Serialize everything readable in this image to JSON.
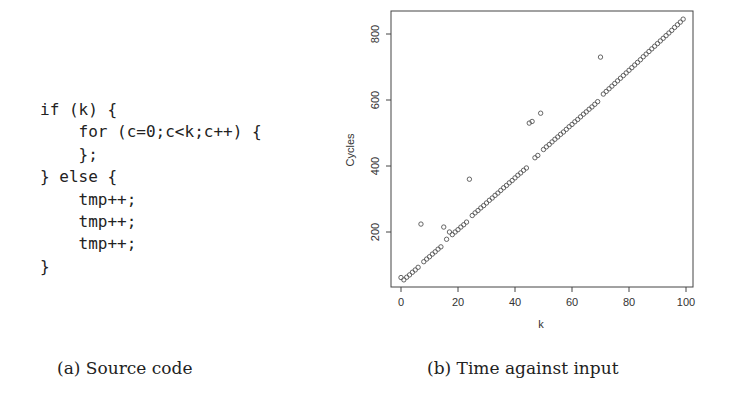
{
  "figure": {
    "panel_a": {
      "caption": "(a) Source code",
      "code_lines": [
        "if (k) {",
        "    for (c=0;c<k;c++) {",
        "    };",
        "} else {",
        "    tmp++;",
        "    tmp++;",
        "    tmp++;",
        "}"
      ]
    },
    "panel_b": {
      "caption": "(b) Time against input"
    }
  },
  "chart_data": {
    "type": "scatter",
    "title": "",
    "xlabel": "k",
    "ylabel": "Cycles",
    "xlim": [
      0,
      100
    ],
    "ylim": [
      33,
      870
    ],
    "xticks": [
      0,
      20,
      40,
      60,
      80,
      100
    ],
    "yticks": [
      200,
      400,
      600,
      800
    ],
    "grid": false,
    "legend": null,
    "marker": "open-circle",
    "x": [
      0,
      1,
      2,
      3,
      4,
      5,
      6,
      7,
      8,
      9,
      10,
      11,
      12,
      13,
      14,
      15,
      16,
      17,
      18,
      19,
      20,
      21,
      22,
      23,
      24,
      25,
      26,
      27,
      28,
      29,
      30,
      31,
      32,
      33,
      34,
      35,
      36,
      37,
      38,
      39,
      40,
      41,
      42,
      43,
      44,
      45,
      46,
      47,
      48,
      49,
      50,
      51,
      52,
      53,
      54,
      55,
      56,
      57,
      58,
      59,
      60,
      61,
      62,
      63,
      64,
      65,
      66,
      67,
      68,
      69,
      70,
      71,
      72,
      73,
      74,
      75,
      76,
      77,
      78,
      79,
      80,
      81,
      82,
      83,
      84,
      85,
      86,
      87,
      88,
      89,
      90,
      91,
      92,
      93,
      94,
      95,
      96,
      97,
      98,
      99
    ],
    "y": [
      62,
      55,
      63,
      70,
      78,
      85,
      93,
      224,
      110,
      118,
      125,
      133,
      140,
      148,
      155,
      215,
      178,
      200,
      192,
      200,
      207,
      215,
      222,
      230,
      360,
      250,
      258,
      265,
      273,
      280,
      288,
      296,
      303,
      311,
      318,
      326,
      334,
      341,
      349,
      356,
      364,
      372,
      379,
      387,
      394,
      530,
      535,
      425,
      432,
      560,
      450,
      458,
      465,
      473,
      481,
      488,
      496,
      503,
      511,
      519,
      526,
      534,
      541,
      549,
      557,
      564,
      572,
      579,
      587,
      595,
      730,
      618,
      626,
      634,
      642,
      650,
      658,
      666,
      674,
      682,
      690,
      698,
      706,
      714,
      722,
      731,
      739,
      747,
      755,
      763,
      771,
      779,
      787,
      795,
      803,
      811,
      820,
      828,
      836,
      845
    ],
    "annotations": []
  }
}
